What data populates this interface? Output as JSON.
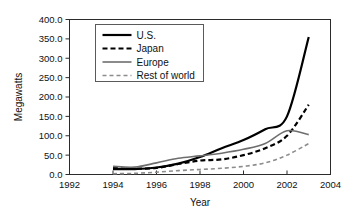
{
  "chart_data": {
    "type": "line",
    "title": "",
    "xlabel": "Year",
    "ylabel": "Megawatts",
    "xlim": [
      1992,
      2004
    ],
    "ylim": [
      0,
      400
    ],
    "grid": false,
    "legend_position": "top-left-inside",
    "xticks": [
      "1992",
      "1994",
      "1996",
      "1998",
      "2000",
      "2002",
      "2004"
    ],
    "xtick_values": [
      1992,
      1994,
      1996,
      1998,
      2000,
      2002,
      2004
    ],
    "yticks": [
      "0.0",
      "50.0",
      "100.0",
      "150.0",
      "200.0",
      "250.0",
      "300.0",
      "350.0",
      "400.0"
    ],
    "ytick_values": [
      0,
      50,
      100,
      150,
      200,
      250,
      300,
      350,
      400
    ],
    "x": [
      1994,
      1995,
      1996,
      1997,
      1998,
      1999,
      2000,
      2001,
      2002,
      2003
    ],
    "series": [
      {
        "name": "U.S.",
        "style": "solid",
        "color": "#000000",
        "width": 2.2,
        "values": [
          14,
          14,
          18,
          28,
          45,
          68,
          89,
          117,
          150,
          355
        ]
      },
      {
        "name": "Japan",
        "style": "dashed",
        "color": "#000000",
        "width": 2.2,
        "values": [
          17,
          15,
          17,
          27,
          36,
          39,
          50,
          68,
          100,
          180
        ]
      },
      {
        "name": "Europe",
        "style": "solid",
        "color": "#6e6e6e",
        "width": 1.6,
        "values": [
          21,
          19,
          30,
          42,
          48,
          55,
          65,
          80,
          113,
          103
        ]
      },
      {
        "name": "Rest of world",
        "style": "dashed",
        "color": "#8c8c8c",
        "width": 1.6,
        "values": [
          2,
          3,
          6,
          10,
          13,
          16,
          21,
          30,
          50,
          80
        ]
      }
    ]
  }
}
